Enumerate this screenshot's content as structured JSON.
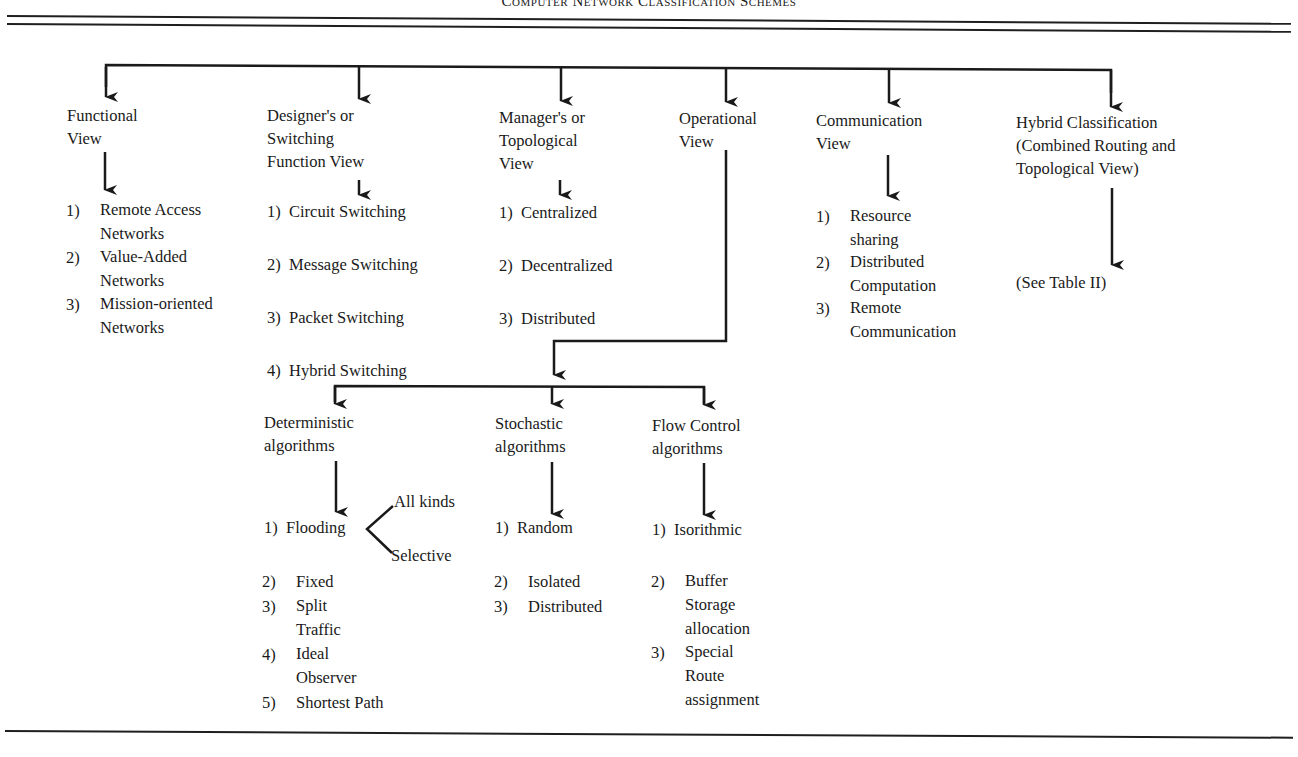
{
  "title": "Computer Network Classification Schemes",
  "views": [
    {
      "id": "functional",
      "label": "Functional\nView",
      "items": [
        {
          "num": "1)",
          "text": "Remote Access\nNetworks"
        },
        {
          "num": "2)",
          "text": "Value-Added\nNetworks"
        },
        {
          "num": "3)",
          "text": "Mission-oriented\nNetworks"
        }
      ]
    },
    {
      "id": "designer",
      "label": "Designer's or\nSwitching\nFunction View",
      "items": [
        {
          "num": "1)",
          "text": "Circuit Switching"
        },
        {
          "num": "2)",
          "text": "Message Switching"
        },
        {
          "num": "3)",
          "text": "Packet Switching"
        },
        {
          "num": "4)",
          "text": "Hybrid Switching"
        }
      ]
    },
    {
      "id": "manager",
      "label": "Manager's or\nTopological\nView",
      "items": [
        {
          "num": "1)",
          "text": "Centralized"
        },
        {
          "num": "2)",
          "text": "Decentralized"
        },
        {
          "num": "3)",
          "text": "Distributed"
        }
      ]
    },
    {
      "id": "operational",
      "label": "Operational\nView",
      "children": [
        {
          "id": "deterministic",
          "label": "Deterministic\nalgorithms",
          "items": [
            {
              "num": "1)",
              "text": "Flooding",
              "branches": [
                "All kinds",
                "Selective"
              ]
            },
            {
              "num": "2)",
              "text": "Fixed"
            },
            {
              "num": "3)",
              "text": "Split\nTraffic"
            },
            {
              "num": "4)",
              "text": "Ideal\nObserver"
            },
            {
              "num": "5)",
              "text": "Shortest Path"
            }
          ]
        },
        {
          "id": "stochastic",
          "label": "Stochastic\nalgorithms",
          "items": [
            {
              "num": "1)",
              "text": "Random"
            },
            {
              "num": "2)",
              "text": "Isolated"
            },
            {
              "num": "3)",
              "text": "Distributed"
            }
          ]
        },
        {
          "id": "flow-control",
          "label": "Flow Control\nalgorithms",
          "items": [
            {
              "num": "1)",
              "text": "Isorithmic"
            },
            {
              "num": "2)",
              "text": "Buffer\nStorage\nallocation"
            },
            {
              "num": "3)",
              "text": "Special\nRoute\nassignment"
            }
          ]
        }
      ]
    },
    {
      "id": "communication",
      "label": "Communication\nView",
      "items": [
        {
          "num": "1)",
          "text": "Resource\nsharing"
        },
        {
          "num": "2)",
          "text": "Distributed\nComputation"
        },
        {
          "num": "3)",
          "text": "Remote\nCommunication"
        }
      ]
    },
    {
      "id": "hybrid",
      "label": "Hybrid Classification\n(Combined Routing and\nTopological View)",
      "note": "(See Table II)"
    }
  ]
}
